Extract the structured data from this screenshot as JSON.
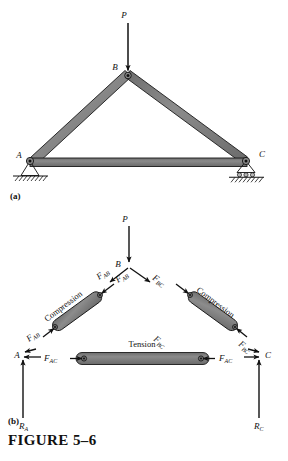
{
  "figure": {
    "caption": "FIGURE 5–6",
    "part_a_label": "(a)",
    "part_b_label": "(b)"
  },
  "colors": {
    "member_fill": "#808080",
    "member_stroke": "#1a1a1a",
    "ground_line": "#111111",
    "arrow": "#111111",
    "text": "#111111",
    "page_background": "#ffffff"
  },
  "part_a": {
    "joints": [
      {
        "name": "A",
        "label": "A",
        "support": "pin"
      },
      {
        "name": "B",
        "label": "B",
        "support": "none"
      },
      {
        "name": "C",
        "label": "C",
        "support": "roller"
      }
    ],
    "load": {
      "label": "P",
      "direction": "down",
      "applied_at": "B"
    },
    "members": [
      {
        "name": "AB",
        "from": "A",
        "to": "B"
      },
      {
        "name": "BC",
        "from": "B",
        "to": "C"
      },
      {
        "name": "AC",
        "from": "A",
        "to": "C"
      }
    ]
  },
  "part_b": {
    "load": {
      "label": "P",
      "direction": "down",
      "applied_at": "B"
    },
    "joint_labels": {
      "A": "A",
      "B": "B",
      "C": "C"
    },
    "reactions": [
      {
        "name": "R_A",
        "base": "R",
        "sub": "A",
        "direction": "up",
        "at": "A"
      },
      {
        "name": "R_C",
        "base": "R",
        "sub": "C",
        "direction": "up",
        "at": "C"
      }
    ],
    "member_states": {
      "left_diagonal": "Compression",
      "right_diagonal": "Compression",
      "bottom_chord": "Tension"
    },
    "forces": [
      {
        "name": "F_AB_at_B",
        "base": "F",
        "sub": "AB",
        "at": "B",
        "on": "joint"
      },
      {
        "name": "F_BC_at_B",
        "base": "F",
        "sub": "BC",
        "at": "B",
        "on": "joint"
      },
      {
        "name": "F_AB_at_A",
        "base": "F",
        "sub": "AB",
        "at": "A",
        "on": "joint"
      },
      {
        "name": "F_AC_at_A",
        "base": "F",
        "sub": "AC",
        "at": "A",
        "on": "joint"
      },
      {
        "name": "F_BC_at_C",
        "base": "F",
        "sub": "BC",
        "at": "C",
        "on": "joint"
      },
      {
        "name": "F_AC_at_C",
        "base": "F",
        "sub": "AC",
        "at": "C",
        "on": "joint"
      }
    ]
  }
}
